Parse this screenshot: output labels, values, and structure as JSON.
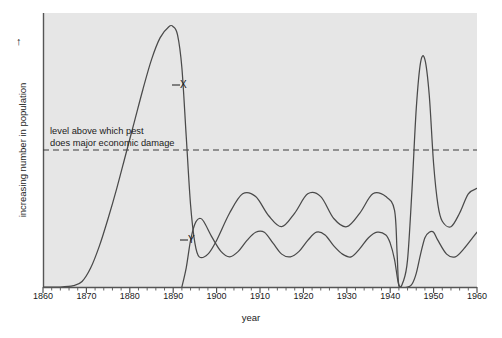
{
  "chart_data": {
    "type": "line",
    "title": "",
    "subtitle": "",
    "xlabel": "year",
    "ylabel": "increasing number in population",
    "ylabel_arrow": "↑",
    "xlim": [
      1860,
      1960
    ],
    "ylim": [
      0,
      100
    ],
    "y_axis_ticks_shown": false,
    "grid": false,
    "legend_position": "inline-labels",
    "x_ticks_major": [
      1860,
      1870,
      1880,
      1890,
      1900,
      1910,
      1920,
      1930,
      1940,
      1950,
      1960
    ],
    "x_tick_labels": [
      "1860",
      "1870",
      "1880",
      "1890",
      "1900",
      "1910",
      "1920",
      "1930",
      "1940",
      "1950",
      "1960"
    ],
    "x_minor_tick_interval": 2,
    "annotations": [
      {
        "name": "economic-threshold",
        "text_line1": "level above which pest",
        "text_line2": "does major economic damage",
        "y_value": 50,
        "style": "dashed-horizontal-line"
      }
    ],
    "series": [
      {
        "name": "X",
        "label": "X",
        "description": "pest population",
        "color": "#4a4a4a",
        "points": [
          [
            1860,
            0
          ],
          [
            1864,
            0
          ],
          [
            1867,
            0.5
          ],
          [
            1869,
            2
          ],
          [
            1871,
            7
          ],
          [
            1873,
            15
          ],
          [
            1875,
            25
          ],
          [
            1877,
            36
          ],
          [
            1879,
            48
          ],
          [
            1881,
            60
          ],
          [
            1883,
            72
          ],
          [
            1885,
            83
          ],
          [
            1887,
            91
          ],
          [
            1889,
            95
          ],
          [
            1890,
            95
          ],
          [
            1891,
            92
          ],
          [
            1892,
            80
          ],
          [
            1893,
            55
          ],
          [
            1894,
            30
          ],
          [
            1895,
            16
          ],
          [
            1896,
            11
          ],
          [
            1898,
            12
          ],
          [
            1900,
            17
          ],
          [
            1903,
            27
          ],
          [
            1906,
            34
          ],
          [
            1909,
            33
          ],
          [
            1912,
            26
          ],
          [
            1915,
            22
          ],
          [
            1918,
            27
          ],
          [
            1921,
            34
          ],
          [
            1924,
            33
          ],
          [
            1927,
            25
          ],
          [
            1930,
            22
          ],
          [
            1933,
            27
          ],
          [
            1936,
            34
          ],
          [
            1939,
            33
          ],
          [
            1941,
            28
          ],
          [
            1941.6,
            12
          ],
          [
            1942,
            0.5
          ],
          [
            1943,
            2
          ],
          [
            1944,
            10
          ],
          [
            1945,
            35
          ],
          [
            1946,
            65
          ],
          [
            1947,
            82
          ],
          [
            1948,
            83
          ],
          [
            1949,
            70
          ],
          [
            1950,
            45
          ],
          [
            1951,
            30
          ],
          [
            1952,
            24
          ],
          [
            1954,
            22
          ],
          [
            1956,
            27
          ],
          [
            1958,
            34
          ],
          [
            1960,
            36
          ]
        ]
      },
      {
        "name": "Y",
        "label": "Y",
        "description": "natural enemy population",
        "color": "#4a4a4a",
        "points": [
          [
            1892,
            0
          ],
          [
            1893,
            7
          ],
          [
            1894,
            17
          ],
          [
            1895,
            23
          ],
          [
            1896,
            25
          ],
          [
            1897,
            24
          ],
          [
            1899,
            18
          ],
          [
            1901,
            13
          ],
          [
            1903,
            11
          ],
          [
            1905,
            13
          ],
          [
            1907,
            17
          ],
          [
            1909,
            20
          ],
          [
            1911,
            20
          ],
          [
            1913,
            16
          ],
          [
            1915,
            12
          ],
          [
            1917,
            11
          ],
          [
            1919,
            13
          ],
          [
            1921,
            17
          ],
          [
            1923,
            20
          ],
          [
            1925,
            19
          ],
          [
            1927,
            15
          ],
          [
            1929,
            12
          ],
          [
            1931,
            11
          ],
          [
            1933,
            14
          ],
          [
            1935,
            18
          ],
          [
            1937,
            20
          ],
          [
            1939,
            19
          ],
          [
            1940,
            16
          ],
          [
            1941,
            10
          ],
          [
            1941.8,
            2
          ],
          [
            1942.4,
            0
          ],
          [
            1944,
            0
          ],
          [
            1945,
            1
          ],
          [
            1946,
            5
          ],
          [
            1947,
            12
          ],
          [
            1948,
            18
          ],
          [
            1949,
            20
          ],
          [
            1950,
            20
          ],
          [
            1951,
            17
          ],
          [
            1953,
            12
          ],
          [
            1955,
            11
          ],
          [
            1957,
            14
          ],
          [
            1959,
            18
          ],
          [
            1960,
            20
          ]
        ]
      }
    ]
  },
  "labels": {
    "x_axis_title": "year",
    "y_axis_title": "increasing number in population",
    "y_axis_arrow": "↑",
    "threshold_line1": "level above which pest",
    "threshold_line2": "does major economic damage",
    "series_x_tag": "X",
    "series_y_tag": "Y"
  },
  "ticks": {
    "x": [
      "1860",
      "1870",
      "1880",
      "1890",
      "1900",
      "1910",
      "1920",
      "1930",
      "1940",
      "1950",
      "1960"
    ]
  },
  "colors": {
    "plot_background": "#e6e6e6",
    "page_background": "#ffffff",
    "axis": "#555555",
    "curve": "#4a4a4a",
    "threshold": "#3a3a3a",
    "text": "#1a1a1a"
  }
}
